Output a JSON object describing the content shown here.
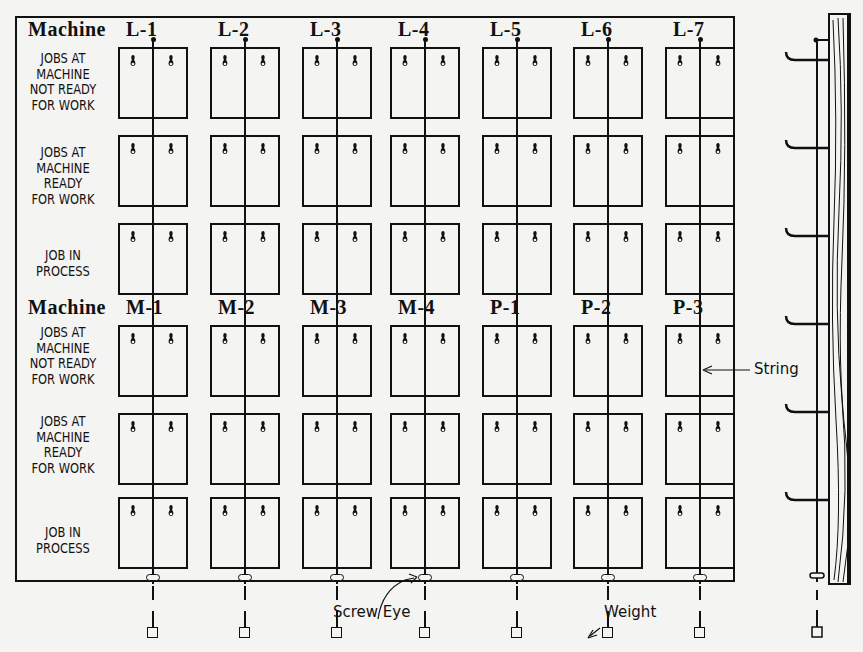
{
  "diagram": {
    "machine_label": "Machine",
    "groups": [
      {
        "columns": [
          "L-1",
          "L-2",
          "L-3",
          "L-4",
          "L-5",
          "L-6",
          "L-7"
        ],
        "rows": [
          "JOBS AT\nMACHINE\nNOT READY\nFOR WORK",
          "JOBS AT\nMACHINE\nREADY\nFOR WORK",
          "JOB IN\nPROCESS"
        ]
      },
      {
        "columns": [
          "M-1",
          "M-2",
          "M-3",
          "M-4",
          "P-1",
          "P-2",
          "P-3"
        ],
        "rows": [
          "JOBS AT\nMACHINE\nNOT READY\nFOR WORK",
          "JOBS AT\nMACHINE\nREADY\nFOR WORK",
          "JOB IN\nPROCESS"
        ]
      }
    ],
    "annotations": {
      "string": "String",
      "screw_eye": "Screw Eye",
      "weight": "Weight"
    },
    "colors": {
      "ink": "#111111",
      "paper": "#f4f4f2",
      "bleed_text": "#d8d8d4"
    }
  }
}
